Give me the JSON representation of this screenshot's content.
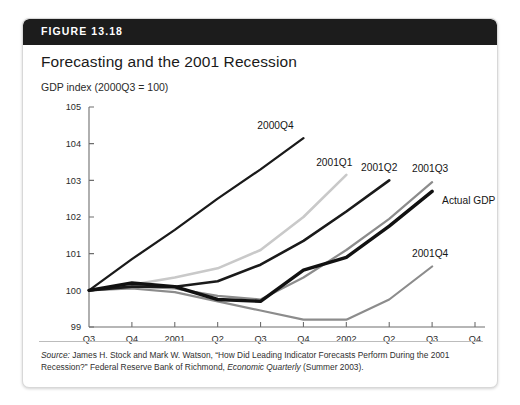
{
  "figure": {
    "number_label": "FIGURE 13.18",
    "title": "Forecasting and the 2001 Recession",
    "y_axis_caption": "GDP index (2000Q3 = 100)",
    "source_prefix": "Source:",
    "source_body_1": " James H. Stock and Mark W. Watson, “How Did Leading Indicator Forecasts Perform During the 2001 Recession?” Federal Reserve Bank of Richmond, ",
    "source_italic": "Economic Quarterly",
    "source_body_2": " (Summer 2003)."
  },
  "colors": {
    "header_bar": "#1c1c1c",
    "actual_gdp": "#111111",
    "forecast_dark": "#1a1a1a",
    "forecast_mid_gray": "#8c8c8c",
    "forecast_light_gray": "#c9c9c9",
    "axis": "#6e6e6e",
    "card_border": "#d8d8d8"
  },
  "chart_data": {
    "type": "line",
    "title": "Forecasting and the 2001 Recession",
    "xlabel": "Year",
    "ylabel": "GDP index (2000Q3 = 100)",
    "ylim": [
      99,
      105
    ],
    "yticks": [
      99,
      100,
      101,
      102,
      103,
      104,
      105
    ],
    "ytick_labels": [
      "99",
      "100",
      "101",
      "102",
      "103",
      "104",
      "105"
    ],
    "grid": false,
    "legend": "inline-end-labels",
    "x": [
      "2000Q3",
      "2000Q4",
      "2001Q1",
      "2001Q2",
      "2001Q3",
      "2001Q4",
      "2002Q1",
      "2002Q2",
      "2002Q3",
      "2002Q4"
    ],
    "xtick_labels": [
      "Q3",
      "Q4",
      "2001",
      "Q2",
      "Q3",
      "Q4",
      "2002",
      "Q2",
      "Q3",
      "Q4"
    ],
    "series": [
      {
        "name": "Actual GDP",
        "label": "Actual GDP",
        "style": "thick-black",
        "color": "#111111",
        "width": 3.4,
        "x": [
          "2000Q3",
          "2000Q4",
          "2001Q1",
          "2001Q2",
          "2001Q3",
          "2001Q4",
          "2002Q1",
          "2002Q2",
          "2002Q3"
        ],
        "values": [
          100.0,
          100.2,
          100.1,
          99.75,
          99.7,
          100.55,
          100.9,
          101.75,
          102.7
        ]
      },
      {
        "name": "2000Q4 forecast",
        "label": "2000Q4",
        "style": "thin-black",
        "color": "#1a1a1a",
        "width": 2.3,
        "x": [
          "2000Q3",
          "2000Q4",
          "2001Q1",
          "2001Q2",
          "2001Q3",
          "2001Q4"
        ],
        "values": [
          100.0,
          100.85,
          101.65,
          102.5,
          103.3,
          104.15
        ]
      },
      {
        "name": "2001Q1 forecast",
        "label": "2001Q1",
        "style": "light-gray",
        "color": "#c9c9c9",
        "width": 2.6,
        "x": [
          "2000Q3",
          "2000Q4",
          "2001Q1",
          "2001Q2",
          "2001Q3",
          "2001Q4",
          "2002Q1"
        ],
        "values": [
          100.0,
          100.15,
          100.35,
          100.6,
          101.1,
          102.0,
          103.15
        ]
      },
      {
        "name": "2001Q2 forecast",
        "label": "2001Q2",
        "style": "thin-black",
        "color": "#1a1a1a",
        "width": 2.6,
        "x": [
          "2000Q3",
          "2000Q4",
          "2001Q1",
          "2001Q2",
          "2001Q3",
          "2001Q4",
          "2002Q1",
          "2002Q2"
        ],
        "values": [
          100.0,
          100.1,
          100.1,
          100.25,
          100.7,
          101.35,
          102.15,
          103.0
        ]
      },
      {
        "name": "2001Q3 forecast",
        "label": "2001Q3",
        "style": "mid-gray",
        "color": "#8c8c8c",
        "width": 2.2,
        "x": [
          "2000Q3",
          "2000Q4",
          "2001Q1",
          "2001Q2",
          "2001Q3",
          "2001Q4",
          "2002Q1",
          "2002Q2",
          "2002Q3"
        ],
        "values": [
          100.0,
          100.1,
          100.05,
          99.85,
          99.75,
          100.35,
          101.1,
          101.95,
          102.95
        ]
      },
      {
        "name": "2001Q4 forecast",
        "label": "2001Q4",
        "style": "mid-gray",
        "color": "#8c8c8c",
        "width": 2.2,
        "x": [
          "2000Q3",
          "2000Q4",
          "2001Q1",
          "2001Q2",
          "2001Q3",
          "2001Q4",
          "2002Q1",
          "2002Q2",
          "2002Q3"
        ],
        "values": [
          100.0,
          100.05,
          99.95,
          99.7,
          99.45,
          99.2,
          99.2,
          99.75,
          100.65
        ]
      }
    ],
    "annotations": [
      {
        "text": "2000Q4",
        "for": "2000Q4 forecast"
      },
      {
        "text": "2001Q1",
        "for": "2001Q1 forecast"
      },
      {
        "text": "2001Q2",
        "for": "2001Q2 forecast"
      },
      {
        "text": "2001Q3",
        "for": "2001Q3 forecast"
      },
      {
        "text": "Actual GDP",
        "for": "Actual GDP"
      },
      {
        "text": "2001Q4",
        "for": "2001Q4 forecast"
      }
    ]
  }
}
